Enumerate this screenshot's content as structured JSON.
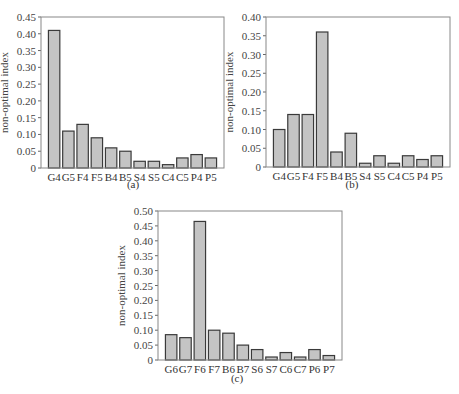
{
  "chart_data": [
    {
      "type": "bar",
      "caption": "(a)",
      "title": "",
      "xlabel": "",
      "ylabel": "non-optimal index",
      "ylim": [
        0,
        0.45
      ],
      "yticks": [
        "0",
        "0.05",
        "0.10",
        "0.15",
        "0.20",
        "0.25",
        "0.30",
        "0.35",
        "0.40",
        "0.45"
      ],
      "grid": false,
      "categories": [
        "G4",
        "G5",
        "F4",
        "F5",
        "B4",
        "B5",
        "S4",
        "S5",
        "C4",
        "C5",
        "P4",
        "P5"
      ],
      "values": [
        0.41,
        0.11,
        0.13,
        0.09,
        0.06,
        0.05,
        0.02,
        0.02,
        0.01,
        0.03,
        0.04,
        0.03
      ]
    },
    {
      "type": "bar",
      "caption": "(b)",
      "title": "",
      "xlabel": "",
      "ylabel": "non-optimal index",
      "ylim": [
        0,
        0.4
      ],
      "yticks": [
        "0",
        "0.05",
        "0.10",
        "0.15",
        "0.20",
        "0.25",
        "0.30",
        "0.35",
        "0.40"
      ],
      "grid": false,
      "categories": [
        "G4",
        "G5",
        "F4",
        "F5",
        "B4",
        "B5",
        "S4",
        "S5",
        "C4",
        "C5",
        "P4",
        "P5"
      ],
      "values": [
        0.1,
        0.14,
        0.14,
        0.36,
        0.04,
        0.09,
        0.01,
        0.03,
        0.01,
        0.03,
        0.02,
        0.03
      ]
    },
    {
      "type": "bar",
      "caption": "(c)",
      "title": "",
      "xlabel": "",
      "ylabel": "non-optimal index",
      "ylim": [
        0,
        0.5
      ],
      "yticks": [
        "0",
        "0.05",
        "0.10",
        "0.15",
        "0.20",
        "0.25",
        "0.30",
        "0.35",
        "0.40",
        "0.45",
        "0.50"
      ],
      "grid": false,
      "categories": [
        "G6",
        "G7",
        "F6",
        "F7",
        "B6",
        "B7",
        "S6",
        "S7",
        "C6",
        "C7",
        "P6",
        "P7"
      ],
      "values": [
        0.085,
        0.075,
        0.465,
        0.1,
        0.09,
        0.05,
        0.035,
        0.01,
        0.025,
        0.01,
        0.035,
        0.015
      ]
    }
  ],
  "layout": [
    {
      "left": 41,
      "top": 17,
      "right": 224,
      "bottom": 168,
      "capX": 133,
      "capY": 188
    },
    {
      "left": 266,
      "top": 17,
      "right": 450,
      "bottom": 167,
      "capX": 352,
      "capY": 188
    },
    {
      "left": 158,
      "top": 211,
      "right": 342,
      "bottom": 360,
      "capX": 237,
      "capY": 382
    }
  ],
  "style": {
    "bar_fill": "#c4c4c4",
    "bar_stroke": "#3a3a3a",
    "frame": "#888888"
  }
}
